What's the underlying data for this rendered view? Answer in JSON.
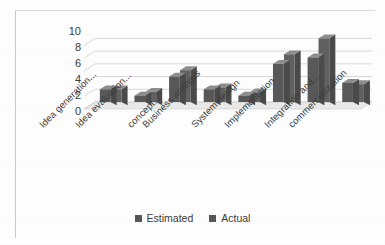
{
  "chart_data": {
    "type": "bar",
    "title": "",
    "xlabel": "",
    "ylabel": "",
    "ylim": [
      0,
      11
    ],
    "yticks": [
      0,
      2,
      4,
      6,
      8,
      10
    ],
    "grid": true,
    "legend_position": "bottom",
    "style": "3d-clustered-column",
    "categories": [
      "Idea generation...",
      "Idea evaluation...",
      "concept...",
      "Business analysis",
      "System design",
      "Implementation",
      "Integration and...",
      "commercialization"
    ],
    "series": [
      {
        "name": "Estimated",
        "color": "#585858",
        "values": [
          2,
          1,
          4,
          2,
          1,
          6,
          7,
          3
        ]
      },
      {
        "name": "Actual",
        "color": "#606060",
        "values": [
          2,
          1.6,
          5,
          2.3,
          1.5,
          7.5,
          10,
          2.8
        ]
      }
    ]
  },
  "legend": {
    "items": [
      {
        "label": "Estimated",
        "color": "#565656"
      },
      {
        "label": "Actual",
        "color": "#565656"
      }
    ]
  },
  "colors": {
    "bar_front": "#5c5c5c",
    "bar_top": "#8d8d8d",
    "bar_side": "#4a4a4a",
    "gridline": "#c9c9c9",
    "floor": "#e9e9e9",
    "text": "#3a3a3a",
    "background": "#fdfdfd"
  }
}
